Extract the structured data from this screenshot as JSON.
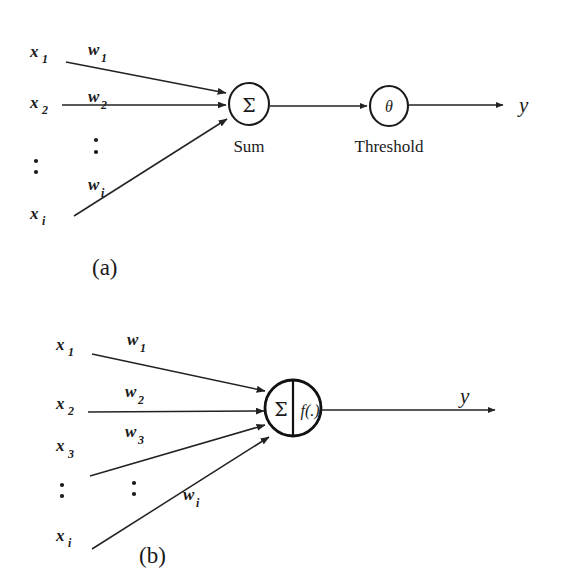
{
  "figure": {
    "background_color": "#ffffff",
    "ink_color": "#1a1a1a",
    "panels": [
      {
        "id": "a",
        "label": "(a)",
        "inputs": [
          {
            "name": "x1",
            "base": "x",
            "sub": "1"
          },
          {
            "name": "x2",
            "base": "x",
            "sub": "2"
          },
          {
            "name": "xi",
            "base": "x",
            "sub": "i"
          }
        ],
        "input_vertical_ellipsis": "⋮",
        "weights": [
          {
            "name": "w1",
            "base": "w",
            "sub": "1"
          },
          {
            "name": "w2",
            "base": "w",
            "sub": "2"
          },
          {
            "name": "wi",
            "base": "w",
            "sub": "i"
          }
        ],
        "weight_vertical_ellipsis": "⋮",
        "nodes": [
          {
            "id": "sum",
            "glyph": "Σ",
            "caption": "Sum"
          },
          {
            "id": "threshold",
            "glyph": "θ",
            "caption": "Threshold"
          }
        ],
        "output": {
          "name": "y",
          "label": "y"
        }
      },
      {
        "id": "b",
        "label": "(b)",
        "inputs": [
          {
            "name": "x1",
            "base": "x",
            "sub": "1"
          },
          {
            "name": "x2",
            "base": "x",
            "sub": "2"
          },
          {
            "name": "x3",
            "base": "x",
            "sub": "3"
          },
          {
            "name": "xi",
            "base": "x",
            "sub": "i"
          }
        ],
        "input_vertical_ellipsis": "⋮",
        "weights": [
          {
            "name": "w1",
            "base": "w",
            "sub": "1"
          },
          {
            "name": "w2",
            "base": "w",
            "sub": "2"
          },
          {
            "name": "w3",
            "base": "w",
            "sub": "3"
          },
          {
            "name": "wi",
            "base": "w",
            "sub": "i"
          }
        ],
        "weight_vertical_ellipsis": "⋮",
        "nodes": [
          {
            "id": "sum-activation",
            "glyph_left": "Σ",
            "glyph_right": "f(.)",
            "caption": ""
          }
        ],
        "output": {
          "name": "y",
          "label": "y"
        }
      }
    ]
  }
}
